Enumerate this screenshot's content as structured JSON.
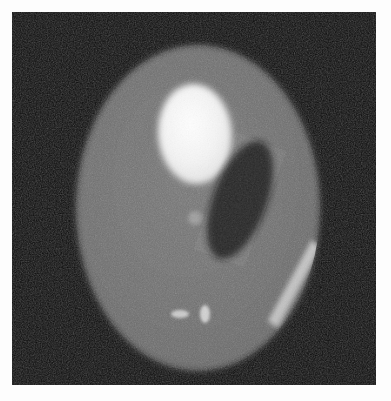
{
  "image": {
    "title": "CT Phantom Axial Slice",
    "modality": "CT",
    "view": "axial",
    "width": 391,
    "height": 401,
    "frame": {
      "border_color": "#fdfdfd",
      "border_width": 12
    },
    "background": {
      "name": "air-background",
      "color": "#0a0a0a",
      "noise": "heavy-speckle"
    }
  },
  "structures": [
    {
      "id": "phantom-body",
      "label": "Phantom body ellipse",
      "shape": "ellipse",
      "cx": 186,
      "cy": 196,
      "rx": 122,
      "ry": 163,
      "rotation": 0,
      "fill": "#6c6c6c",
      "intensity": "soft-tissue"
    },
    {
      "id": "bright-lesion",
      "label": "Large hyperdense ellipse",
      "shape": "ellipse",
      "cx": 183,
      "cy": 122,
      "rx": 37,
      "ry": 50,
      "rotation": -4,
      "fill": "#f2f2f2",
      "intensity": "hyperdense"
    },
    {
      "id": "dark-lesion",
      "label": "Tilted hypodense ellipse",
      "shape": "ellipse",
      "cx": 228,
      "cy": 188,
      "rx": 27,
      "ry": 62,
      "rotation": 20,
      "fill": "#1b1b1b",
      "intensity": "hypodense"
    },
    {
      "id": "center-dot",
      "label": "Small central bright dot",
      "shape": "ellipse",
      "cx": 183,
      "cy": 206,
      "rx": 7,
      "ry": 7,
      "rotation": 0,
      "fill": "#9b9b9b",
      "intensity": "mildly-hyperdense"
    },
    {
      "id": "inferior-dot-left",
      "label": "Small inferior horizontal bright object",
      "shape": "ellipse",
      "cx": 168,
      "cy": 302,
      "rx": 9,
      "ry": 4,
      "rotation": 0,
      "fill": "#c9c9c9",
      "intensity": "hyperdense"
    },
    {
      "id": "inferior-dot-right",
      "label": "Small inferior vertical bright object",
      "shape": "ellipse",
      "cx": 193,
      "cy": 302,
      "rx": 5,
      "ry": 9,
      "rotation": 0,
      "fill": "#cfcfcf",
      "intensity": "hyperdense"
    },
    {
      "id": "lateral-streak",
      "label": "Right lateral bright streak artifact",
      "shape": "streak",
      "fill": "#d9d9d9",
      "intensity": "hyperdense"
    }
  ],
  "palette": {
    "air": "#0a0a0a",
    "soft_tissue": "#6c6c6c",
    "hyperdense": "#f2f2f2",
    "hypodense": "#1b1b1b",
    "frame": "#fdfdfd"
  }
}
